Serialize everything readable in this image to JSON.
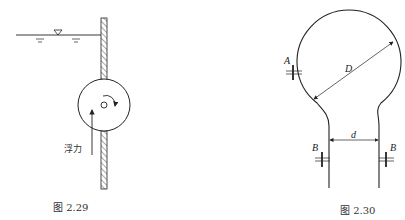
{
  "figures": [
    {
      "id": "fig-2-29",
      "caption": "图 2.29",
      "labels": {
        "buoyancy": "浮力"
      },
      "elements": [
        "water-surface",
        "free-surface-symbol",
        "vertical-wall-hatched",
        "rotating-cylinder",
        "pivot-axis",
        "rotation-arrow",
        "buoyancy-arrow"
      ]
    },
    {
      "id": "fig-2-30",
      "caption": "图 2.30",
      "labels": {
        "bulb_diameter": "D",
        "neck_diameter": "d",
        "section_A": "A",
        "section_B_left": "B",
        "section_B_right": "B"
      },
      "elements": [
        "bulb-outline",
        "neck-tube",
        "diameter-D-dimension",
        "diameter-d-dimension",
        "section-A-marker",
        "section-B-markers"
      ]
    }
  ],
  "colors": {
    "line": "#222222",
    "text": "#333333",
    "background": "#ffffff"
  }
}
